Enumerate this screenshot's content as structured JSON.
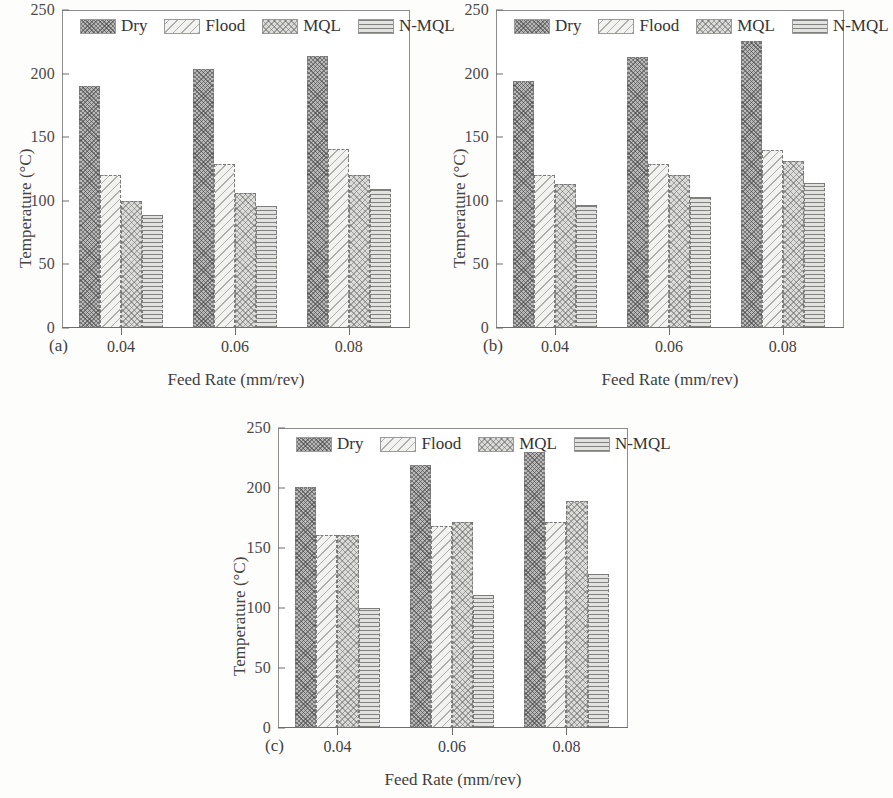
{
  "figure": {
    "axis_titles": {
      "y": "Temperature (°C)",
      "x": "Feed Rate (mm/rev)"
    },
    "y_ticks": [
      "0",
      "50",
      "100",
      "150",
      "200",
      "250"
    ],
    "x_ticks": [
      "0.04",
      "0.06",
      "0.08"
    ],
    "legend": [
      {
        "label": "Dry",
        "pattern": "dense-cross-hatch",
        "color": "#b8b8b8"
      },
      {
        "label": "Flood",
        "pattern": "sparse-diagonal",
        "color": "#f2f2f0"
      },
      {
        "label": "MQL",
        "pattern": "light-cross-hatch",
        "color": "#dcdcda"
      },
      {
        "label": "N-MQL",
        "pattern": "horizontal-lines",
        "color": "#e2e2e0"
      }
    ],
    "panels": [
      {
        "tag": "(a)"
      },
      {
        "tag": "(b)"
      },
      {
        "tag": "(c)"
      }
    ]
  },
  "chart_data": [
    {
      "type": "bar",
      "title": "(a)",
      "xlabel": "Feed Rate (mm/rev)",
      "ylabel": "Temperature (°C)",
      "ylim": [
        0,
        250
      ],
      "yticks": [
        0,
        50,
        100,
        150,
        200,
        250
      ],
      "grid": false,
      "legend_position": "top-inside",
      "categories": [
        "0.04",
        "0.06",
        "0.08"
      ],
      "series": [
        {
          "name": "Dry",
          "values": [
            190,
            204,
            214
          ]
        },
        {
          "name": "Flood",
          "values": [
            120,
            129,
            141
          ]
        },
        {
          "name": "MQL",
          "values": [
            100,
            106,
            120
          ]
        },
        {
          "name": "N-MQL",
          "values": [
            89,
            96,
            109
          ]
        }
      ]
    },
    {
      "type": "bar",
      "title": "(b)",
      "xlabel": "Feed Rate (mm/rev)",
      "ylabel": "Temperature (°C)",
      "ylim": [
        0,
        250
      ],
      "yticks": [
        0,
        50,
        100,
        150,
        200,
        250
      ],
      "grid": false,
      "legend_position": "top-inside",
      "categories": [
        "0.04",
        "0.06",
        "0.08"
      ],
      "series": [
        {
          "name": "Dry",
          "values": [
            194,
            213,
            226
          ]
        },
        {
          "name": "Flood",
          "values": [
            120,
            129,
            140
          ]
        },
        {
          "name": "MQL",
          "values": [
            113,
            120,
            131
          ]
        },
        {
          "name": "N-MQL",
          "values": [
            97,
            103,
            114
          ]
        }
      ]
    },
    {
      "type": "bar",
      "title": "(c)",
      "xlabel": "Feed Rate (mm/rev)",
      "ylabel": "Temperature (°C)",
      "ylim": [
        0,
        250
      ],
      "yticks": [
        0,
        50,
        100,
        150,
        200,
        250
      ],
      "grid": false,
      "legend_position": "top-inside",
      "categories": [
        "0.04",
        "0.06",
        "0.08"
      ],
      "series": [
        {
          "name": "Dry",
          "values": [
            201,
            219,
            230
          ]
        },
        {
          "name": "Flood",
          "values": [
            161,
            168,
            172
          ]
        },
        {
          "name": "MQL",
          "values": [
            161,
            172,
            189
          ]
        },
        {
          "name": "N-MQL",
          "values": [
            100,
            111,
            128
          ]
        }
      ]
    }
  ]
}
